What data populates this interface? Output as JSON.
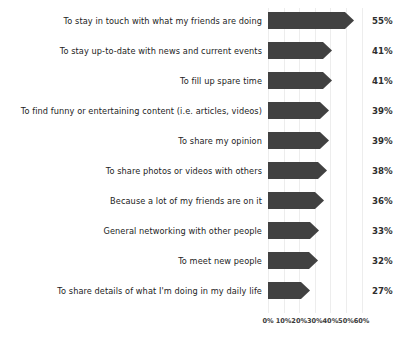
{
  "chart_data": {
    "type": "bar",
    "orientation": "horizontal",
    "title": "",
    "subtitle": "",
    "xlabel": "",
    "ylabel": "",
    "xlim": [
      0,
      60
    ],
    "xticks": [
      0,
      10,
      20,
      30,
      40,
      50,
      60
    ],
    "xtick_labels": [
      "0%",
      "10%",
      "20%",
      "30%",
      "40%",
      "50%",
      "60%"
    ],
    "grid": "vertical",
    "legend": "none",
    "value_suffix": "%",
    "bar_color": "#414141",
    "grid_color": "#ededed",
    "categories": [
      "To stay in touch with what my friends are doing",
      "To stay up-to-date with news and current events",
      "To fill up spare time",
      "To find funny or entertaining content (i.e. articles, videos)",
      "To share my opinion",
      "To share photos or videos with others",
      "Because a lot of my friends are on it",
      "General networking with other people",
      "To meet new people",
      "To share details of what I'm doing in my daily life"
    ],
    "values": [
      55,
      41,
      41,
      39,
      39,
      38,
      36,
      33,
      32,
      27
    ],
    "value_labels": [
      "55%",
      "41%",
      "41%",
      "39%",
      "39%",
      "38%",
      "36%",
      "33%",
      "32%",
      "27%"
    ]
  }
}
